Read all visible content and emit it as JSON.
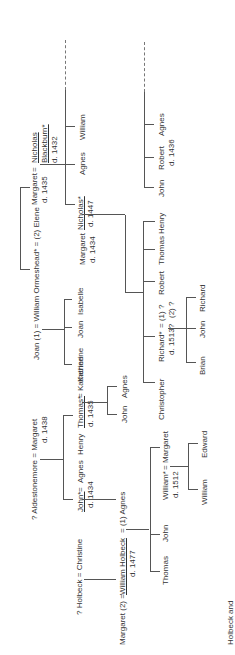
{
  "caption": "Holbeck and",
  "blackburn": {
    "wife": "Margaret",
    "wife_d": "d. 1435",
    "eq": "=",
    "husband1": "Nicholas",
    "husband2": "Blackburn*",
    "husband_d": "d. 1432",
    "children": [
      "Nicholas*",
      "Agnes",
      "William"
    ],
    "nicholas_d": "d. 1447"
  },
  "branch2": {
    "children": [
      "John",
      "Robert",
      "Agnes"
    ],
    "robert_d": "d. 1436"
  },
  "ormeshead": {
    "line": "Joan (1) = William Ormeshead* = (2) Elene",
    "children": [
      "Katherine",
      "Joan",
      "Isabelle"
    ]
  },
  "nicholas_jr": {
    "wife": "Margaret",
    "wife_d": "d. 1434",
    "eq": "=",
    "husband": "Nicholas*",
    "husband_d": "d. 1447",
    "children": [
      "Christopher",
      "Richard*",
      "Robert",
      "Thomas",
      "Henry"
    ],
    "richard_d": "d. 1513?",
    "richard_spouses1": "= (1) ?",
    "richard_spouses2": "(2) ?",
    "grandchildren": [
      "Brian",
      "John",
      "Richard"
    ]
  },
  "aldestonemore": {
    "line1": "? Aldestonemore = Margaret",
    "line2": "d. 1438",
    "children": [
      "John*",
      "Agnes",
      "Henry",
      "Thomas*"
    ],
    "john_d": "d. 1434",
    "thomas_d": "d. 1435",
    "eq": "=",
    "john_spouse_eq": "=",
    "thomas_spouse": "= Katherine",
    "thomas_children": [
      "John",
      "Agnes"
    ]
  },
  "holbeck": {
    "parents": "? Holbeck = Christine",
    "line": [
      "Margaret (2) =",
      "William Holbeck",
      "= (1) Agnes"
    ],
    "william_d": "d. 1477",
    "children": [
      "Thomas",
      "John",
      "William*"
    ],
    "william_jr_spouse": "= Margaret",
    "william_jr_d": "d. 1512",
    "grandchildren": [
      "William",
      "Edward"
    ]
  }
}
